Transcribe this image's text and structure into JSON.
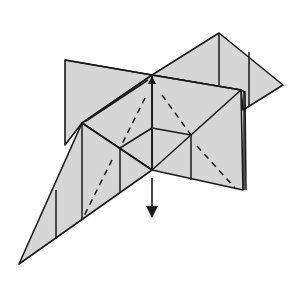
{
  "diagram": {
    "type": "origami-folding-step",
    "colors": {
      "paper": "#d6d6d6",
      "line": "#1a1a1a",
      "background": "#ffffff"
    },
    "line_types": [
      "edge",
      "crease",
      "valley-fold (dashed)"
    ],
    "annotations": [
      {
        "kind": "arrow",
        "direction": "down",
        "meaning": "push down / collapse"
      },
      {
        "kind": "arrow",
        "direction": "up",
        "meaning": "small arrowhead at top center"
      }
    ],
    "text_labels": []
  }
}
